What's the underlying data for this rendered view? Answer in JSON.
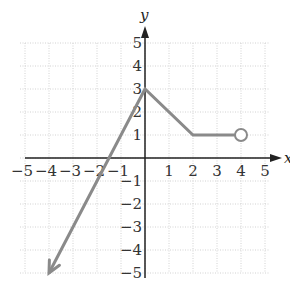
{
  "chart_data": {
    "type": "line",
    "title": "",
    "xlabel": "x",
    "ylabel": "y",
    "xlim": [
      -5,
      5
    ],
    "ylim": [
      -5,
      5
    ],
    "grid": true,
    "x_ticks": [
      "−5",
      "−4",
      "−3",
      "−2",
      "−1",
      "1",
      "2",
      "3",
      "4",
      "5"
    ],
    "y_ticks": [
      "5",
      "4",
      "3",
      "2",
      "1",
      "−1",
      "−2",
      "−3",
      "−4",
      "−5"
    ],
    "series": [
      {
        "name": "piecewise function",
        "points": [
          [
            -4,
            -5
          ],
          [
            0,
            3
          ],
          [
            2,
            1
          ],
          [
            4,
            1
          ]
        ],
        "start_marker": "arrow at (-4,-5) indicating continuation",
        "end_marker": "open circle at (4,1)"
      }
    ],
    "colors": {
      "curve": "#8a8a8a",
      "grid": "#cfcfcf",
      "axis": "#222222"
    },
    "legend": null
  }
}
